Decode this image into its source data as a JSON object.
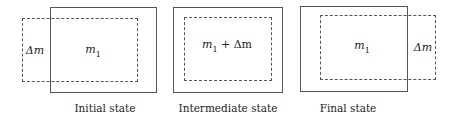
{
  "states": [
    {
      "caption": "Initial state",
      "inner_label_var": "m",
      "inner_label_sub": "1",
      "side_label": "Δm"
    },
    {
      "caption": "Intermediate state",
      "inner_label_var": "m",
      "inner_label_sub": "1",
      "inner_label_suffix": " + Δm"
    },
    {
      "caption": "Final state",
      "inner_label_var": "m",
      "inner_label_sub": "1",
      "side_label": "Δm"
    }
  ]
}
